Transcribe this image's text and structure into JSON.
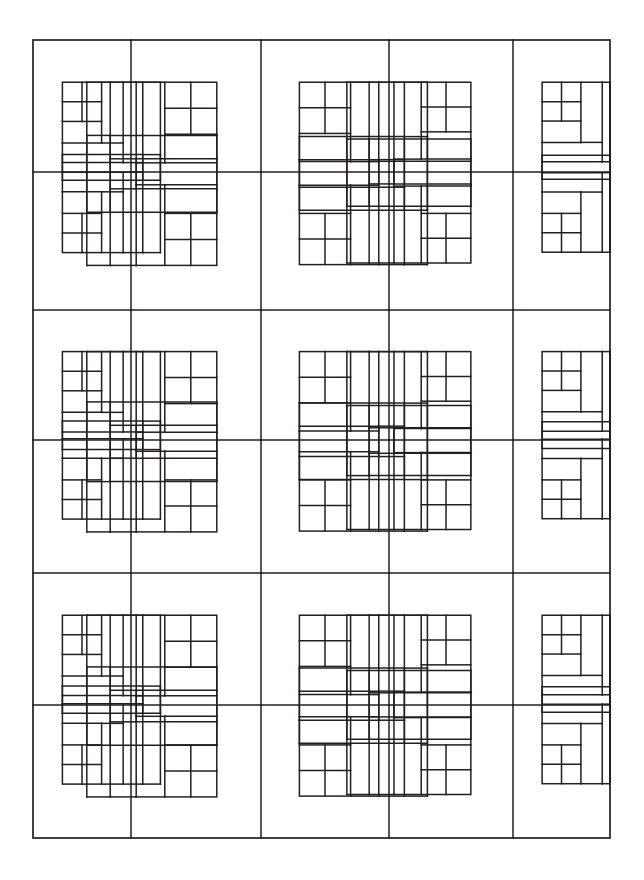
{
  "document": {
    "title": "Quilt Block Pattern Line Drawing",
    "description": "Black-and-white line drawing of a pieced quilt layout: a 5-column by 6-row grid of rotating courthouse-steps blocks, each built from a four-patch center framed by concentric strips, producing an interlaced basket-weave appearance.",
    "background_color": "#ffffff",
    "line_color": "#231f20",
    "line_width": 1.5
  },
  "canvas": {
    "width": 644,
    "height": 880
  },
  "pattern": {
    "name": "courthouse-steps-basket-weave",
    "outline": {
      "x": 33,
      "y": 40,
      "width": 577,
      "height": 798
    },
    "columns": 5,
    "rows": 6,
    "column_edges": [
      33,
      131,
      261,
      389,
      513,
      610
    ],
    "row_edges": [
      40,
      172,
      310,
      440,
      573,
      705,
      838
    ],
    "four_patch_label": "four-patch-center",
    "strip_label": "log-strip",
    "rotations": [
      [
        "A",
        "B",
        "A",
        "B",
        "A"
      ],
      [
        "C",
        "D",
        "C",
        "D",
        "C"
      ],
      [
        "A",
        "B",
        "A",
        "B",
        "A"
      ],
      [
        "C",
        "D",
        "C",
        "D",
        "C"
      ],
      [
        "A",
        "B",
        "A",
        "B",
        "A"
      ],
      [
        "C",
        "D",
        "C",
        "D",
        "C"
      ]
    ],
    "block_geometry": {
      "unit": 1,
      "center_frac": 0.4,
      "strip_fracs": [
        0.22,
        0.2,
        0.18
      ]
    }
  },
  "chart_data": {
    "type": "table",
    "xlabel": "",
    "ylabel": "",
    "grid": true,
    "legend": "none",
    "columns": [
      "block",
      "row",
      "col",
      "rotation",
      "x",
      "y",
      "width",
      "height"
    ],
    "rows": [
      [
        "block-r1c1",
        1,
        1,
        "A",
        33,
        40,
        98,
        132
      ],
      [
        "block-r1c2",
        1,
        2,
        "B",
        131,
        40,
        130,
        132
      ],
      [
        "block-r1c3",
        1,
        3,
        "A",
        261,
        40,
        128,
        132
      ],
      [
        "block-r1c4",
        1,
        4,
        "B",
        389,
        40,
        124,
        132
      ],
      [
        "block-r1c5",
        1,
        5,
        "A",
        513,
        40,
        97,
        132
      ],
      [
        "block-r2c1",
        2,
        1,
        "C",
        33,
        172,
        98,
        138
      ],
      [
        "block-r2c2",
        2,
        2,
        "D",
        131,
        172,
        130,
        138
      ],
      [
        "block-r2c3",
        2,
        3,
        "C",
        261,
        172,
        128,
        138
      ],
      [
        "block-r2c4",
        2,
        4,
        "D",
        389,
        172,
        124,
        138
      ],
      [
        "block-r2c5",
        2,
        5,
        "C",
        513,
        172,
        97,
        138
      ],
      [
        "block-r3c1",
        3,
        1,
        "A",
        33,
        310,
        98,
        130
      ],
      [
        "block-r3c2",
        3,
        2,
        "B",
        131,
        310,
        130,
        130
      ],
      [
        "block-r3c3",
        3,
        3,
        "A",
        261,
        310,
        128,
        130
      ],
      [
        "block-r3c4",
        3,
        4,
        "B",
        389,
        310,
        124,
        130
      ],
      [
        "block-r3c5",
        3,
        5,
        "A",
        513,
        310,
        97,
        130
      ],
      [
        "block-r4c1",
        4,
        1,
        "C",
        33,
        440,
        98,
        133
      ],
      [
        "block-r4c2",
        4,
        2,
        "D",
        131,
        440,
        130,
        133
      ],
      [
        "block-r4c3",
        4,
        3,
        "C",
        261,
        440,
        128,
        133
      ],
      [
        "block-r4c4",
        4,
        4,
        "D",
        389,
        440,
        124,
        133
      ],
      [
        "block-r4c5",
        4,
        5,
        "C",
        513,
        440,
        97,
        133
      ],
      [
        "block-r5c1",
        5,
        1,
        "A",
        33,
        573,
        98,
        132
      ],
      [
        "block-r5c2",
        5,
        2,
        "B",
        131,
        573,
        130,
        132
      ],
      [
        "block-r5c3",
        5,
        3,
        "A",
        261,
        573,
        128,
        132
      ],
      [
        "block-r5c4",
        5,
        4,
        "B",
        389,
        573,
        124,
        132
      ],
      [
        "block-r5c5",
        5,
        5,
        "A",
        513,
        573,
        97,
        132
      ],
      [
        "block-r6c1",
        6,
        1,
        "C",
        33,
        705,
        98,
        133
      ],
      [
        "block-r6c2",
        6,
        2,
        "D",
        131,
        705,
        130,
        133
      ],
      [
        "block-r6c3",
        6,
        3,
        "C",
        261,
        705,
        128,
        133
      ],
      [
        "block-r6c4",
        6,
        4,
        "D",
        389,
        705,
        124,
        133
      ],
      [
        "block-r6c5",
        6,
        5,
        "C",
        513,
        705,
        97,
        133
      ]
    ]
  }
}
